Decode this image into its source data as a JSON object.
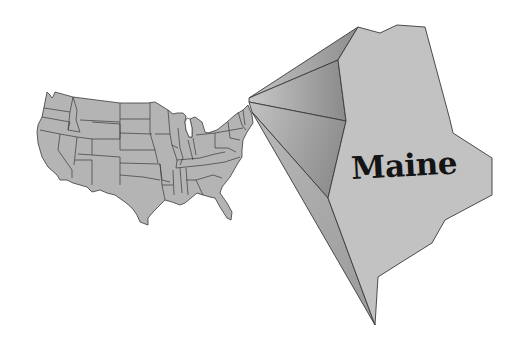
{
  "map": {
    "title": "Maine",
    "highlighted_state": "Maine",
    "base_map": "United States (contiguous states)",
    "colors": {
      "background": "#ffffff",
      "us_fill": "#b4b4b4",
      "us_border": "#3a3a3a",
      "maine_fill": "#c2c2c2",
      "callout_dark": "#8c8c8c",
      "callout_light": "#bcbcbc",
      "label": "#141414"
    }
  },
  "labels": {
    "maine": "Maine"
  }
}
